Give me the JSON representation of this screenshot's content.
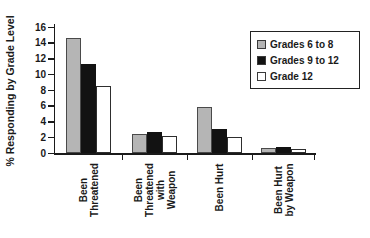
{
  "figure": {
    "background": "#ffffff"
  },
  "chart_data": {
    "type": "bar",
    "title": "",
    "xlabel": "",
    "ylabel": "% Responding by Grade Level",
    "ylim": [
      0,
      16
    ],
    "ytick_step": 2,
    "grid": false,
    "legend_position": "upper right",
    "categories": [
      "Been Threatened",
      "Been Threatened with Weapon",
      "Been Hurt",
      "Been Hurt by Weapon"
    ],
    "category_lines": [
      [
        "Been",
        "Threatened"
      ],
      [
        "Been",
        "Threatened",
        "with",
        "Weapon"
      ],
      [
        "Been Hurt"
      ],
      [
        "Been Hurt",
        "by Weapon"
      ]
    ],
    "series": [
      {
        "name": "Grades 6 to 8",
        "color": "#b5b5b5",
        "border": "#4a4a4a",
        "values": [
          14.6,
          2.4,
          5.9,
          0.6
        ]
      },
      {
        "name": "Grades 9 to 12",
        "color": "#121212",
        "border": "#121212",
        "values": [
          11.3,
          2.7,
          3.1,
          0.7
        ]
      },
      {
        "name": "Grade 12",
        "color": "#ffffff",
        "border": "#2e2e2e",
        "values": [
          8.5,
          2.2,
          2.0,
          0.5
        ]
      }
    ],
    "axis_color": "#1a1a1a"
  }
}
